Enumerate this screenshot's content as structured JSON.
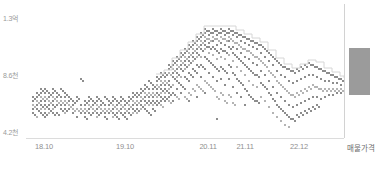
{
  "chart_data": {
    "type": "scatter",
    "title": "",
    "subtitle": "",
    "xlabel": "",
    "ylabel": "",
    "grid": false,
    "legend": null,
    "yticks": [
      {
        "label": "1.3억",
        "value": 130000000,
        "y_px": 19
      },
      {
        "label": "8.6천",
        "value": 86000000,
        "y_px": 76
      },
      {
        "label": "4.2천",
        "value": 42000000,
        "y_px": 133
      }
    ],
    "ylim": [
      42000000,
      130000000
    ],
    "xticks": [
      {
        "label": "18.10",
        "x_px": 44
      },
      {
        "label": "19.10",
        "x_px": 125
      },
      {
        "label": "20.11",
        "x_px": 208
      },
      {
        "label": "21.11",
        "x_px": 245
      },
      {
        "label": "22.12",
        "x_px": 299
      },
      {
        "label": "매물가격",
        "x_px": 361
      }
    ],
    "listing_price_bar": {
      "label": "매물가격",
      "x_px": 349,
      "width_px": 21,
      "top_px": 48,
      "height_px": 47,
      "color": "#9b9b9b"
    },
    "envelope_line_color": "#d6d6d6",
    "point_color": "#8d8d8d",
    "series": [
      {
        "name": "실거래가",
        "columns": [
          {
            "x": 32,
            "ys": [
              96,
              100,
              104,
              108,
              112
            ]
          },
          {
            "x": 36,
            "ys": [
              92,
              96,
              100,
              104,
              108,
              116
            ]
          },
          {
            "x": 40,
            "ys": [
              88,
              92,
              96,
              100,
              104,
              108,
              112
            ]
          },
          {
            "x": 44,
            "ys": [
              88,
              92,
              96,
              100,
              104,
              108,
              112,
              116
            ]
          },
          {
            "x": 48,
            "ys": [
              92,
              96,
              100,
              104,
              108,
              112
            ]
          },
          {
            "x": 52,
            "ys": [
              88,
              92,
              96,
              100,
              104,
              108,
              112
            ]
          },
          {
            "x": 56,
            "ys": [
              92,
              96,
              100,
              104,
              112
            ]
          },
          {
            "x": 60,
            "ys": [
              88,
              96,
              100,
              104,
              108
            ]
          },
          {
            "x": 64,
            "ys": [
              92,
              96,
              100,
              104,
              108,
              112
            ]
          },
          {
            "x": 68,
            "ys": [
              96,
              100,
              104,
              108
            ]
          },
          {
            "x": 72,
            "ys": [
              100,
              104,
              108,
              112
            ]
          },
          {
            "x": 76,
            "ys": [
              96,
              100,
              108,
              116
            ]
          },
          {
            "x": 80,
            "ys": [
              78,
              104,
              108,
              112
            ]
          },
          {
            "x": 84,
            "ys": [
              100,
              104,
              108,
              112,
              116
            ]
          },
          {
            "x": 88,
            "ys": [
              96,
              100,
              104,
              108,
              112
            ]
          },
          {
            "x": 92,
            "ys": [
              100,
              104,
              108,
              112
            ]
          },
          {
            "x": 96,
            "ys": [
              96,
              100,
              104,
              108,
              112,
              116
            ]
          },
          {
            "x": 100,
            "ys": [
              100,
              104,
              108,
              112
            ]
          },
          {
            "x": 104,
            "ys": [
              96,
              104,
              108,
              112,
              116
            ]
          },
          {
            "x": 108,
            "ys": [
              100,
              104,
              108,
              112
            ]
          },
          {
            "x": 112,
            "ys": [
              96,
              100,
              104,
              108,
              112,
              116
            ]
          },
          {
            "x": 116,
            "ys": [
              100,
              104,
              108,
              112,
              116
            ]
          },
          {
            "x": 120,
            "ys": [
              96,
              100,
              104,
              108,
              112
            ]
          },
          {
            "x": 124,
            "ys": [
              100,
              104,
              108,
              112,
              116
            ]
          },
          {
            "x": 128,
            "ys": [
              96,
              100,
              104,
              108,
              112
            ]
          },
          {
            "x": 132,
            "ys": [
              92,
              96,
              100,
              104,
              108,
              112
            ]
          },
          {
            "x": 136,
            "ys": [
              92,
              96,
              100,
              104,
              108,
              112
            ]
          },
          {
            "x": 140,
            "ys": [
              88,
              92,
              96,
              100,
              104,
              108
            ]
          },
          {
            "x": 144,
            "ys": [
              84,
              88,
              92,
              96,
              100,
              104,
              108
            ]
          },
          {
            "x": 148,
            "ys": [
              80,
              88,
              92,
              96,
              100,
              104,
              112
            ]
          },
          {
            "x": 152,
            "ys": [
              84,
              88,
              92,
              96,
              100,
              104,
              108
            ]
          },
          {
            "x": 156,
            "ys": [
              76,
              80,
              84,
              88,
              92,
              96,
              100,
              104
            ]
          },
          {
            "x": 160,
            "ys": [
              72,
              76,
              80,
              84,
              88,
              92,
              96,
              100,
              104
            ]
          },
          {
            "x": 164,
            "ys": [
              72,
              76,
              80,
              84,
              88,
              92,
              96,
              100
            ]
          },
          {
            "x": 168,
            "ys": [
              64,
              68,
              72,
              80,
              84,
              88,
              92,
              96,
              100
            ]
          },
          {
            "x": 172,
            "ys": [
              60,
              64,
              68,
              72,
              76,
              84,
              92,
              100
            ]
          },
          {
            "x": 176,
            "ys": [
              56,
              60,
              64,
              68,
              72,
              76,
              80,
              88,
              96
            ]
          },
          {
            "x": 180,
            "ys": [
              52,
              56,
              60,
              64,
              68,
              76,
              84,
              92
            ]
          },
          {
            "x": 184,
            "ys": [
              48,
              52,
              56,
              60,
              64,
              68,
              76,
              88,
              96
            ]
          },
          {
            "x": 188,
            "ys": [
              44,
              48,
              52,
              56,
              60,
              64,
              72,
              80,
              92,
              100
            ]
          },
          {
            "x": 192,
            "ys": [
              40,
              44,
              48,
              52,
              56,
              60,
              68,
              76,
              88
            ]
          },
          {
            "x": 196,
            "ys": [
              36,
              40,
              44,
              48,
              52,
              56,
              64,
              72,
              84,
              96
            ]
          },
          {
            "x": 200,
            "ys": [
              32,
              36,
              40,
              44,
              48,
              56,
              64,
              76,
              88
            ]
          },
          {
            "x": 204,
            "ys": [
              28,
              32,
              36,
              40,
              44,
              48,
              56,
              68,
              80,
              92
            ]
          },
          {
            "x": 208,
            "ys": [
              30,
              34,
              38,
              42,
              46,
              52,
              60,
              72,
              84
            ]
          },
          {
            "x": 212,
            "ys": [
              28,
              32,
              36,
              40,
              46,
              54,
              64,
              76,
              88
            ]
          },
          {
            "x": 216,
            "ys": [
              30,
              34,
              38,
              44,
              50,
              58,
              68,
              80,
              96,
              118
            ]
          },
          {
            "x": 220,
            "ys": [
              28,
              32,
              36,
              42,
              48,
              56,
              66,
              78,
              92
            ]
          },
          {
            "x": 224,
            "ys": [
              30,
              34,
              38,
              44,
              50,
              58,
              70,
              84,
              100
            ]
          },
          {
            "x": 228,
            "ys": [
              28,
              32,
              36,
              40,
              46,
              54,
              64,
              78,
              94
            ]
          },
          {
            "x": 232,
            "ys": [
              30,
              34,
              40,
              46,
              52,
              60,
              72,
              86,
              102
            ]
          },
          {
            "x": 236,
            "ys": [
              32,
              36,
              42,
              48,
              56,
              66,
              78,
              92
            ]
          },
          {
            "x": 240,
            "ys": [
              34,
              40,
              46,
              52,
              60,
              70,
              82,
              96
            ]
          },
          {
            "x": 244,
            "ys": [
              36,
              42,
              48,
              56,
              64,
              74,
              88,
              104
            ]
          },
          {
            "x": 248,
            "ys": [
              38,
              44,
              50,
              58,
              68,
              80,
              94
            ]
          },
          {
            "x": 252,
            "ys": [
              40,
              46,
              54,
              62,
              72,
              84,
              98
            ]
          },
          {
            "x": 256,
            "ys": [
              42,
              48,
              56,
              64,
              74,
              86,
              100
            ]
          },
          {
            "x": 260,
            "ys": [
              44,
              52,
              60,
              70,
              82,
              96
            ]
          },
          {
            "x": 264,
            "ys": [
              48,
              56,
              64,
              74,
              86,
              100
            ]
          },
          {
            "x": 268,
            "ys": [
              52,
              60,
              70,
              80,
              92,
              106
            ]
          },
          {
            "x": 272,
            "ys": [
              56,
              64,
              74,
              86,
              98,
              112
            ]
          },
          {
            "x": 276,
            "ys": [
              60,
              70,
              80,
              92,
              104,
              116
            ]
          },
          {
            "x": 280,
            "ys": [
              64,
              74,
              84,
              96,
              108,
              120
            ]
          },
          {
            "x": 284,
            "ys": [
              66,
              76,
              88,
              100,
              112,
              124
            ]
          },
          {
            "x": 288,
            "ys": [
              68,
              80,
              92,
              104,
              116,
              126
            ]
          },
          {
            "x": 292,
            "ys": [
              70,
              82,
              94,
              106,
              118
            ]
          },
          {
            "x": 296,
            "ys": [
              68,
              80,
              92,
              104,
              114
            ]
          },
          {
            "x": 300,
            "ys": [
              66,
              78,
              90,
              102,
              112
            ]
          },
          {
            "x": 304,
            "ys": [
              64,
              76,
              88,
              100,
              110
            ]
          },
          {
            "x": 308,
            "ys": [
              62,
              74,
              86,
              98,
              108
            ]
          },
          {
            "x": 312,
            "ys": [
              64,
              74,
              84,
              96,
              106
            ]
          },
          {
            "x": 316,
            "ys": [
              66,
              76,
              86,
              96,
              104
            ]
          },
          {
            "x": 320,
            "ys": [
              68,
              78,
              88,
              98
            ]
          },
          {
            "x": 324,
            "ys": [
              70,
              80,
              88,
              96
            ]
          },
          {
            "x": 328,
            "ys": [
              72,
              80,
              88,
              94
            ]
          },
          {
            "x": 332,
            "ys": [
              74,
              82,
              88,
              94
            ]
          },
          {
            "x": 336,
            "ys": [
              76,
              82,
              88,
              92
            ]
          },
          {
            "x": 340,
            "ys": [
              78,
              84,
              88,
              92
            ]
          }
        ]
      }
    ],
    "envelope": [
      [
        156,
        74
      ],
      [
        164,
        70
      ],
      [
        172,
        58
      ],
      [
        180,
        50
      ],
      [
        188,
        42
      ],
      [
        196,
        34
      ],
      [
        204,
        26
      ],
      [
        212,
        26
      ],
      [
        220,
        26
      ],
      [
        228,
        26
      ],
      [
        236,
        30
      ],
      [
        244,
        34
      ],
      [
        252,
        38
      ],
      [
        260,
        42
      ],
      [
        268,
        50
      ],
      [
        276,
        58
      ],
      [
        284,
        64
      ],
      [
        292,
        68
      ],
      [
        300,
        64
      ],
      [
        308,
        60
      ],
      [
        316,
        62
      ],
      [
        324,
        68
      ],
      [
        332,
        72
      ],
      [
        340,
        76
      ],
      [
        344,
        78
      ]
    ]
  }
}
